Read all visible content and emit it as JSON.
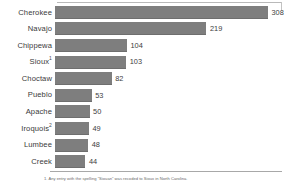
{
  "chart_data": {
    "type": "bar",
    "orientation": "horizontal",
    "title": "",
    "subtitle": "",
    "xlabel": "",
    "ylabel": "",
    "grid": false,
    "legend": null,
    "xlim": [
      0,
      308
    ],
    "categories": [
      "Cherokee",
      "Navajo",
      "Chippewa",
      "Sioux",
      "Choctaw",
      "Pueblo",
      "Apache",
      "Iroquois",
      "Lumbee",
      "Creek"
    ],
    "values": [
      308,
      219,
      104,
      103,
      82,
      53,
      50,
      49,
      48,
      44
    ],
    "value_labels": [
      "308",
      "219",
      "104",
      "103",
      "82",
      "53",
      "50",
      "49",
      "48",
      "44"
    ],
    "category_markers": [
      "",
      "",
      "",
      "1",
      "",
      "",
      "",
      "2",
      "",
      ""
    ],
    "bar_color": "#7e7e7e",
    "background_color": "#ffffff",
    "axis_color": "#a8a8a8"
  },
  "rows": [
    {
      "label": "Cherokee",
      "marker": "",
      "value": 308,
      "value_label": "308"
    },
    {
      "label": "Navajo",
      "marker": "",
      "value": 219,
      "value_label": "219"
    },
    {
      "label": "Chippewa",
      "marker": "",
      "value": 104,
      "value_label": "104"
    },
    {
      "label": "Sioux",
      "marker": "1",
      "value": 103,
      "value_label": "103"
    },
    {
      "label": "Choctaw",
      "marker": "",
      "value": 82,
      "value_label": "82"
    },
    {
      "label": "Pueblo",
      "marker": "",
      "value": 53,
      "value_label": "53"
    },
    {
      "label": "Apache",
      "marker": "",
      "value": 50,
      "value_label": "50"
    },
    {
      "label": "Iroquois",
      "marker": "2",
      "value": 49,
      "value_label": "49"
    },
    {
      "label": "Lumbee",
      "marker": "",
      "value": 48,
      "value_label": "48"
    },
    {
      "label": "Creek",
      "marker": "",
      "value": 44,
      "value_label": "44"
    }
  ],
  "footnotes": [
    "1. Any entry with the spelling \"Siouan\" was recoded to Sioux in North Carolina."
  ]
}
